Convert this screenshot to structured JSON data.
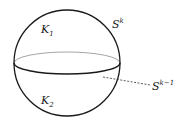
{
  "diagram": {
    "labels": {
      "upper_region": "K",
      "upper_region_sub": "1",
      "lower_region": "K",
      "lower_region_sub": "2",
      "sphere": "S",
      "sphere_sup": "k",
      "equator": "S",
      "equator_sup": "k−1"
    },
    "colors": {
      "outline": "#1a1a1a",
      "back_equator": "#9a9a9a",
      "dashed_leader": "#333333"
    }
  }
}
